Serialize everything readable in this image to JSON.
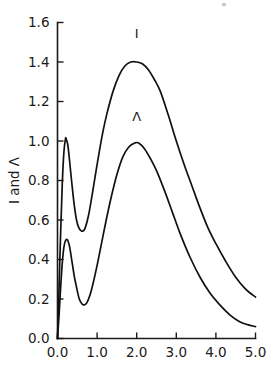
{
  "chart_data": {
    "type": "line",
    "title": "",
    "subtitle": "",
    "xlabel": "",
    "ylabel": "I and Λ",
    "xlim": [
      0.0,
      5.0
    ],
    "ylim": [
      0.0,
      1.6
    ],
    "grid": false,
    "legend_position": "inline-annotations",
    "x_ticks": [
      "0.0",
      "1.0",
      "2.0",
      "3.0",
      "4.0",
      "5.0"
    ],
    "x_tick_values": [
      0.0,
      1.0,
      2.0,
      3.0,
      4.0,
      5.0
    ],
    "y_ticks": [
      "0.0",
      "0.2",
      "0.4",
      "0.6",
      "0.8",
      "1.0",
      "1.2",
      "1.4",
      "1.6"
    ],
    "y_tick_values": [
      0.0,
      0.2,
      0.4,
      0.6,
      0.8,
      1.0,
      1.2,
      1.4,
      1.6
    ],
    "annotations": [
      {
        "text": "I",
        "x": 2.0,
        "y": 1.52
      },
      {
        "text": "Λ",
        "x": 2.0,
        "y": 1.1
      }
    ],
    "series": [
      {
        "name": "I",
        "label": "I",
        "color": "#111111",
        "x": [
          0.0,
          0.04,
          0.08,
          0.12,
          0.16,
          0.2,
          0.22,
          0.26,
          0.3,
          0.36,
          0.42,
          0.48,
          0.54,
          0.6,
          0.65,
          0.7,
          0.78,
          0.86,
          0.95,
          1.05,
          1.15,
          1.25,
          1.4,
          1.55,
          1.7,
          1.85,
          2.0,
          2.15,
          2.3,
          2.45,
          2.6,
          2.8,
          3.0,
          3.2,
          3.4,
          3.6,
          3.8,
          4.0,
          4.25,
          4.5,
          4.75,
          5.0
        ],
        "y": [
          0.0,
          0.26,
          0.54,
          0.78,
          0.94,
          1.01,
          1.01,
          0.98,
          0.91,
          0.79,
          0.68,
          0.6,
          0.56,
          0.545,
          0.545,
          0.56,
          0.62,
          0.71,
          0.82,
          0.94,
          1.05,
          1.14,
          1.25,
          1.33,
          1.38,
          1.4,
          1.4,
          1.39,
          1.36,
          1.31,
          1.25,
          1.13,
          1.0,
          0.88,
          0.77,
          0.66,
          0.56,
          0.48,
          0.39,
          0.31,
          0.25,
          0.21
        ]
      },
      {
        "name": "Λ",
        "label": "Λ",
        "color": "#111111",
        "x": [
          0.0,
          0.04,
          0.08,
          0.12,
          0.16,
          0.2,
          0.25,
          0.3,
          0.35,
          0.42,
          0.48,
          0.55,
          0.62,
          0.68,
          0.74,
          0.82,
          0.9,
          1.0,
          1.1,
          1.22,
          1.35,
          1.5,
          1.65,
          1.8,
          1.95,
          2.05,
          2.2,
          2.35,
          2.5,
          2.7,
          2.9,
          3.1,
          3.35,
          3.6,
          3.85,
          4.1,
          4.35,
          4.6,
          4.8,
          5.0
        ],
        "y": [
          0.0,
          0.12,
          0.26,
          0.38,
          0.46,
          0.495,
          0.5,
          0.47,
          0.41,
          0.32,
          0.26,
          0.2,
          0.175,
          0.17,
          0.18,
          0.22,
          0.28,
          0.37,
          0.47,
          0.59,
          0.71,
          0.83,
          0.92,
          0.97,
          0.99,
          0.99,
          0.96,
          0.91,
          0.85,
          0.75,
          0.64,
          0.53,
          0.41,
          0.31,
          0.23,
          0.17,
          0.12,
          0.085,
          0.07,
          0.06
        ]
      }
    ]
  },
  "figure": {
    "name": "i-and-lambda-plot"
  }
}
